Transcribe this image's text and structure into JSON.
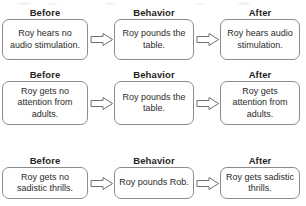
{
  "diagram": {
    "type": "abc-contingency",
    "column_headers": [
      "Before",
      "Behavior",
      "After"
    ],
    "arrow_icon": "block-arrow-right-icon",
    "colors": {
      "box_border": "#8c8c8c",
      "text": "#2b2b2b",
      "header_text": "#1f1f1f",
      "background": "#ffffff",
      "arrow_stroke": "#6f6f6f"
    },
    "rows": [
      {
        "id": "row-1",
        "headers": {
          "before": "Before",
          "behavior": "Behavior",
          "after": "After"
        },
        "before": "Roy hears no audio stimulation.",
        "behavior": "Roy pounds the table.",
        "after": "Roy hears audio stimulation."
      },
      {
        "id": "row-2",
        "headers": {
          "before": "Before",
          "behavior": "Behavior",
          "after": "After"
        },
        "before": "Roy gets no attention from adults.",
        "behavior": "Roy pounds the table.",
        "after": "Roy gets attention from adults."
      },
      {
        "id": "row-3",
        "headers": {
          "before": "Before",
          "behavior": "Behavior",
          "after": "After"
        },
        "before": "Roy gets no sadistic thrills.",
        "behavior": "Roy pounds Rob.",
        "after": "Roy gets sadistic thrills."
      }
    ]
  }
}
